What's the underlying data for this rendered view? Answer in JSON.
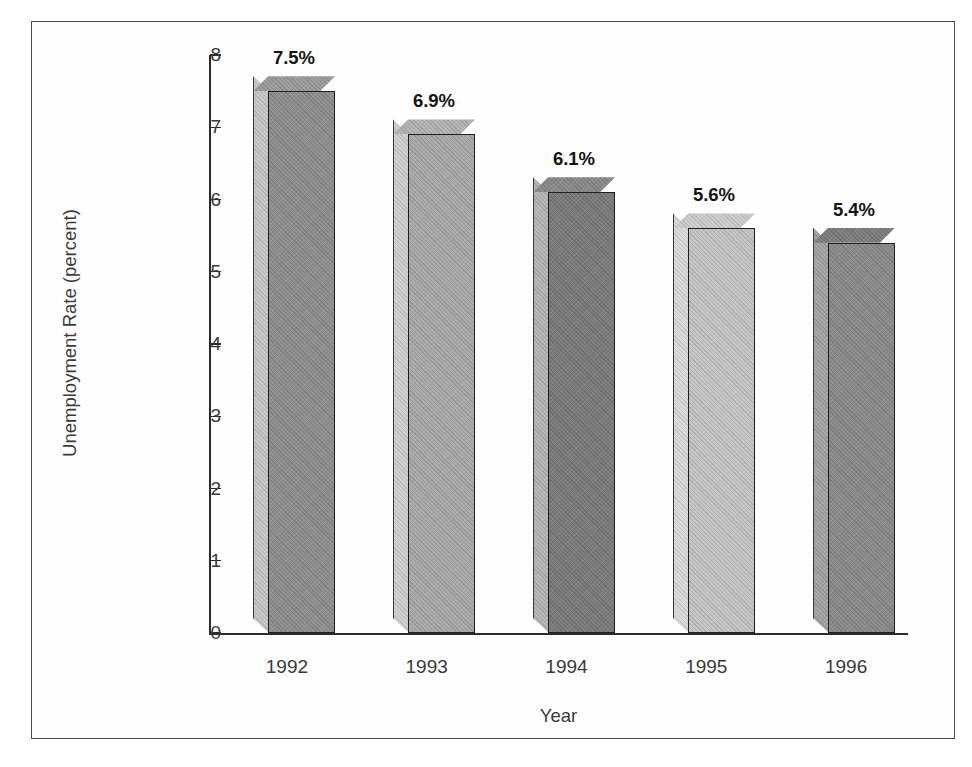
{
  "chart_data": {
    "type": "bar",
    "title": "",
    "subtitle": "",
    "xlabel": "Year",
    "ylabel": "Unemployment Rate (percent)",
    "categories": [
      "1992",
      "1993",
      "1994",
      "1995",
      "1996"
    ],
    "values": [
      7.5,
      6.9,
      6.1,
      5.6,
      5.4
    ],
    "data_labels": [
      "7.5%",
      "6.9%",
      "6.1%",
      "5.6%",
      "5.4%"
    ],
    "ylim": [
      0,
      8
    ],
    "yticks": [
      "8",
      "7",
      "6",
      "5",
      "4",
      "3",
      "2",
      "1",
      "0"
    ],
    "ytick_values": [
      8,
      7,
      6,
      5,
      4,
      3,
      2,
      1,
      0
    ],
    "grid": false,
    "legend": null,
    "legend_position": "none",
    "style": "3d-bar-grayscale",
    "bar_colors": [
      "#8e8e8e",
      "#a8a8a8",
      "#7b7b7b",
      "#c3c3c3",
      "#8a8a8a"
    ],
    "bar_side_colors": [
      "#c6c6c6",
      "#cfcfcf",
      "#b4b4b4",
      "#d9d9d9",
      "#a3a3a3"
    ],
    "bar_top_colors": [
      "#9b9b9b",
      "#b2b2b2",
      "#8a8a8a",
      "#cccccc",
      "#7e7e7e"
    ]
  },
  "colors": {
    "axis": "#2b2b2b",
    "text": "#3a3a3a",
    "label_text": "#151515",
    "frame": "#4a4a4a",
    "background": "#ffffff"
  }
}
